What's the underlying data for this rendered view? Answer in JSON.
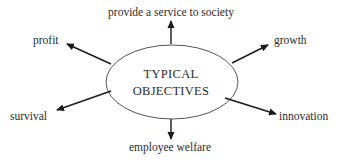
{
  "diagram": {
    "center": {
      "line1": "TYPICAL",
      "line2": "OBJECTIVES"
    },
    "objectives": {
      "top": "provide a service to society",
      "top_left": "profit",
      "top_right": "growth",
      "bottom_left": "survival",
      "bottom_right": "innovation",
      "bottom": "employee welfare"
    },
    "colors": {
      "stroke": "#1a1a1a",
      "ellipse_stroke": "#555555",
      "text": "#2a2a2a",
      "background": "#ffffff"
    }
  }
}
